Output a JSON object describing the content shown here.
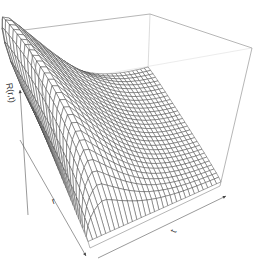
{
  "chart_data": {
    "type": "surface3d",
    "title": "",
    "xlabel": "r",
    "ylabel": "t",
    "zlabel": "R(r,t)",
    "axes_arrows": true,
    "box": true,
    "grid_lines_r": 30,
    "grid_lines_t": 30,
    "surface_model": {
      "peak_r": 0.25,
      "peak_t": 0.18,
      "r_spread": 0.55,
      "t_rise": 0.12,
      "t_decay": 0.25,
      "floor": 0.03
    },
    "colors": {
      "mesh": "#3a3a3a",
      "box": "#8a8a8a",
      "background": "#ffffff"
    }
  },
  "labels": {
    "z": "R(r,t)",
    "r": "r",
    "t": "t"
  }
}
